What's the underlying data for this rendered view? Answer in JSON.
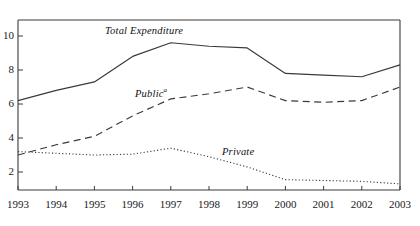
{
  "chart_data": {
    "type": "line",
    "title": "",
    "subtitle": "",
    "xlabel": "",
    "ylabel": "",
    "x": [
      1993,
      1994,
      1995,
      1996,
      1997,
      1998,
      1999,
      2000,
      2001,
      2002,
      2003
    ],
    "xtick_labels": [
      "1993",
      "1994",
      "1995",
      "1996",
      "1997",
      "1998",
      "1999",
      "2000",
      "2001",
      "2002",
      "2003"
    ],
    "ytick_labels": [
      "2",
      "4",
      "6",
      "8",
      "10"
    ],
    "yticks": [
      2,
      4,
      6,
      8,
      10
    ],
    "xlim": [
      1993,
      2003
    ],
    "ylim": [
      0,
      11.2
    ],
    "grid": false,
    "legend_position": "inline-annotations",
    "series": [
      {
        "name": "Total Expenditure",
        "style": "solid",
        "label_text": "Total Expenditure",
        "label_footnote": "",
        "values": [
          6.2,
          6.8,
          7.3,
          8.8,
          9.6,
          9.4,
          9.3,
          7.8,
          7.7,
          7.6,
          8.3
        ]
      },
      {
        "name": "Public",
        "style": "dashed",
        "label_text": "Public",
        "label_footnote": "a",
        "values": [
          3.0,
          3.6,
          4.1,
          5.3,
          6.3,
          6.6,
          7.0,
          6.2,
          6.1,
          6.2,
          7.0
        ]
      },
      {
        "name": "Private",
        "style": "dotted",
        "label_text": "Private",
        "label_footnote": "",
        "values": [
          3.2,
          3.1,
          3.0,
          3.05,
          3.4,
          2.9,
          2.3,
          1.55,
          1.5,
          1.45,
          1.3
        ]
      }
    ],
    "axis_color": "#3a3a3a",
    "line_color": "#3a3a3a",
    "text_color": "#1a1a1a"
  }
}
